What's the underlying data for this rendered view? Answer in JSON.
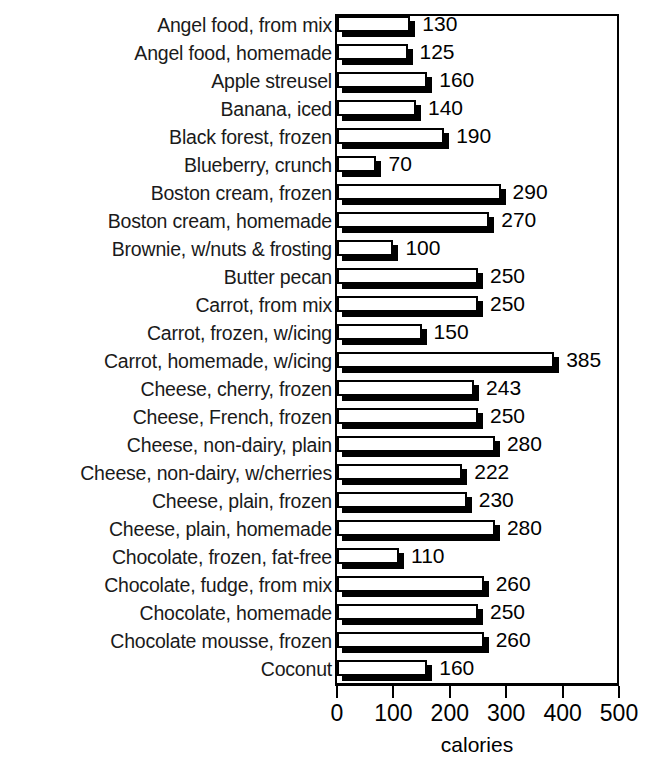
{
  "chart_data": {
    "type": "bar",
    "orientation": "horizontal",
    "title": "",
    "xlabel": "calories",
    "ylabel": "",
    "xlim": [
      0,
      500
    ],
    "xticks": [
      0,
      100,
      200,
      300,
      400,
      500
    ],
    "xtick_labels": [
      "0",
      "100",
      "200",
      "300",
      "400",
      "500"
    ],
    "grid": false,
    "legend": null,
    "categories": [
      "Angel food, from mix",
      "Angel food, homemade",
      "Apple streusel",
      "Banana, iced",
      "Black forest, frozen",
      "Blueberry, crunch",
      "Boston cream, frozen",
      "Boston cream, homemade",
      "Brownie, w/nuts & frosting",
      "Butter pecan",
      "Carrot, from mix",
      "Carrot, frozen, w/icing",
      "Carrot, homemade, w/icing",
      "Cheese, cherry, frozen",
      "Cheese, French, frozen",
      "Cheese, non-dairy, plain",
      "Cheese, non-dairy, w/cherries",
      "Cheese, plain, frozen",
      "Cheese, plain, homemade",
      "Chocolate, frozen, fat-free",
      "Chocolate, fudge, from mix",
      "Chocolate, homemade",
      "Chocolate mousse, frozen",
      "Coconut"
    ],
    "values": [
      130,
      125,
      160,
      140,
      190,
      70,
      290,
      270,
      100,
      250,
      250,
      150,
      385,
      243,
      250,
      280,
      222,
      230,
      280,
      110,
      260,
      250,
      260,
      160
    ],
    "value_labels": [
      "130",
      "125",
      "160",
      "140",
      "190",
      "70",
      "290",
      "270",
      "100",
      "250",
      "250",
      "150",
      "385",
      "243",
      "250",
      "280",
      "222",
      "230",
      "280",
      "110",
      "260",
      "250",
      "260",
      "160"
    ],
    "bar_face_color": "#ffffff",
    "bar_edge_color": "#000000",
    "bar_shadow_color": "#000000"
  }
}
